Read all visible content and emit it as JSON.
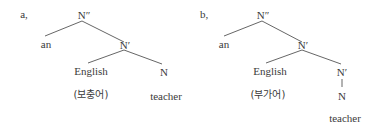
{
  "diagram": {
    "type": "syntax-tree",
    "trees": [
      {
        "id": "a",
        "label": "a,",
        "nodes": {
          "root": "N″",
          "determiner": "an",
          "bar": "N′",
          "complement": "English",
          "complement_gloss": "(보충어)",
          "head": "N",
          "word": "teacher"
        }
      },
      {
        "id": "b",
        "label": "b,",
        "nodes": {
          "root": "N″",
          "determiner": "an",
          "bar": "N′",
          "adjunct": "English",
          "adjunct_gloss": "(부가어)",
          "bar2": "N′",
          "head": "N",
          "word": "teacher"
        }
      }
    ],
    "colors": {
      "text": "#3a3a3a",
      "line": "#555555",
      "background": "#ffffff"
    }
  }
}
